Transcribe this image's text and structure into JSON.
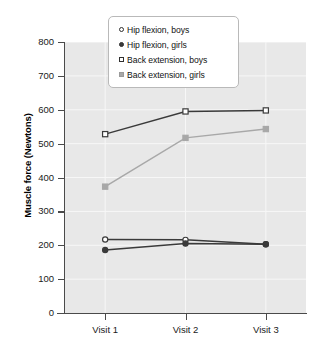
{
  "chart_data": {
    "type": "line",
    "title": "",
    "xlabel": "",
    "ylabel": "Muscle force (Newtons)",
    "categories": [
      "Visit 1",
      "Visit 2",
      "Visit 3"
    ],
    "ylim": [
      0,
      800
    ],
    "yticks": [
      0,
      100,
      200,
      300,
      400,
      500,
      600,
      700,
      800
    ],
    "ytick_labels": [
      "0",
      "100",
      "200",
      "300",
      "400",
      "500",
      "600",
      "700",
      "800"
    ],
    "grid": true,
    "legend_position": "top-center",
    "series": [
      {
        "name": "Hip flexion, boys",
        "marker": "circle-open",
        "color": "#3a3a3a",
        "values": [
          217,
          216,
          203
        ]
      },
      {
        "name": "Hip flexion, girls",
        "marker": "circle-filled",
        "color": "#3a3a3a",
        "values": [
          186,
          205,
          203
        ]
      },
      {
        "name": "Back extension, boys",
        "marker": "square-open",
        "color": "#3a3a3a",
        "values": [
          528,
          595,
          598
        ]
      },
      {
        "name": "Back extension, girls",
        "marker": "square-filled",
        "color": "#a8a8a8",
        "values": [
          373,
          517,
          543
        ]
      }
    ]
  },
  "legend": {
    "items": [
      {
        "label": "Hip flexion, boys"
      },
      {
        "label": "Hip flexion, girls"
      },
      {
        "label": "Back extension, boys"
      },
      {
        "label": "Back extension, girls"
      }
    ]
  },
  "colors": {
    "plot_background": "#e8e8e8",
    "gridline": "#f7f7f7",
    "axis": "#4a4a4a",
    "dark_series": "#3a3a3a",
    "gray_series": "#a8a8a8",
    "legend_border": "#b9b9b9"
  }
}
